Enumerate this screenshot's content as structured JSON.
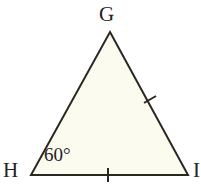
{
  "figure": {
    "kind": "triangle-diagram",
    "background_color": "#ffffff",
    "fill_color": "#fbfbf0",
    "stroke_color": "#2b2822",
    "stroke_width": 2,
    "vertices": {
      "g": {
        "label": "G",
        "x": 110,
        "y": 32
      },
      "h": {
        "label": "H",
        "x": 31,
        "y": 175
      },
      "i": {
        "label": "I",
        "x": 188,
        "y": 175
      }
    },
    "angle_labels": [
      {
        "at": "H",
        "text": "60°"
      }
    ],
    "tick_marks": [
      {
        "side": "GI",
        "count": 1,
        "x": 150,
        "y": 100
      },
      {
        "side": "HI",
        "count": 1,
        "x": 108,
        "y": 175
      }
    ]
  }
}
